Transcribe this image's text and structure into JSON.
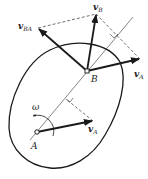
{
  "diagram": {
    "colors": {
      "stroke": "#1a1a1a",
      "background": "#ffffff"
    },
    "points": {
      "A": {
        "label": "A",
        "x": 37,
        "y": 132
      },
      "B": {
        "label": "B",
        "x": 87,
        "y": 71
      }
    },
    "vectors": [
      {
        "id": "vA_at_A",
        "label_main": "v",
        "label_sub": "A",
        "from": [
          37,
          132
        ],
        "to": [
          93,
          121
        ]
      },
      {
        "id": "vA_at_B",
        "label_main": "v",
        "label_sub": "A",
        "from": [
          87,
          71
        ],
        "to": [
          140,
          59
        ]
      },
      {
        "id": "vB",
        "label_main": "v",
        "label_sub": "B",
        "from": [
          87,
          71
        ],
        "to": [
          96,
          14
        ]
      },
      {
        "id": "vBA",
        "label_main": "v",
        "label_sub": "BA",
        "from": [
          87,
          71
        ],
        "to": [
          38,
          28
        ]
      }
    ],
    "angular_velocity": {
      "label": "ω"
    },
    "labels": {
      "A": "A",
      "B": "B",
      "omega": "ω",
      "vA_main": "v",
      "vA_sub": "A",
      "vB_main": "v",
      "vB_sub": "B",
      "vBA_main": "v",
      "vBA_sub": "BA",
      "vA2_main": "v",
      "vA2_sub": "A"
    }
  }
}
